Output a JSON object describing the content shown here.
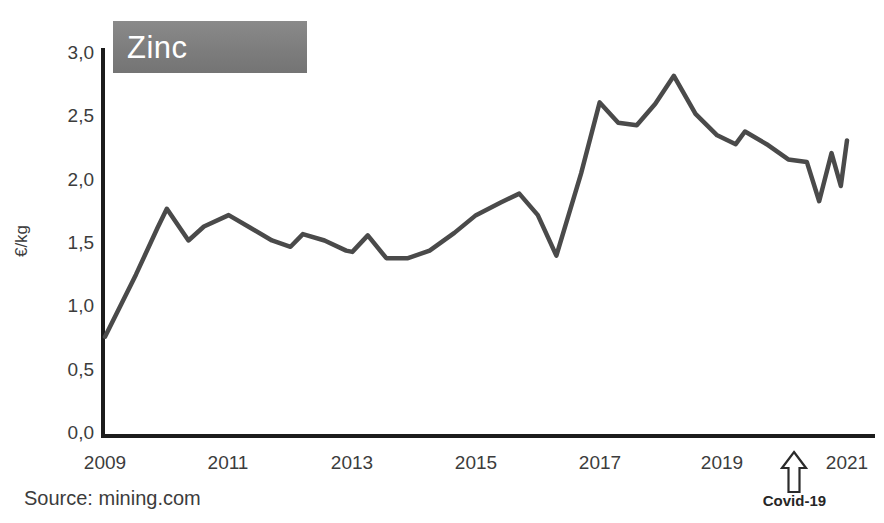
{
  "chart_data": {
    "type": "line",
    "title": "Zinc",
    "xlabel": "",
    "ylabel": "€/kg",
    "ylim": [
      0.0,
      3.0
    ],
    "xlim": [
      2009.0,
      2021.0
    ],
    "yticks": [
      "0,0",
      "0,5",
      "1,0",
      "1,5",
      "2,0",
      "2,5",
      "3,0"
    ],
    "ytick_values": [
      0.0,
      0.5,
      1.0,
      1.5,
      2.0,
      2.5,
      3.0
    ],
    "xticks": [
      "2009",
      "2011",
      "2013",
      "2015",
      "2017",
      "2019",
      "2021"
    ],
    "xtick_values": [
      2009,
      2011,
      2013,
      2015,
      2017,
      2019,
      2021
    ],
    "grid": false,
    "legend": null,
    "series": [
      {
        "name": "Zinc price",
        "unit": "€/kg",
        "color": "#4a4a4a",
        "x": [
          2009.0,
          2009.5,
          2009.85,
          2010.0,
          2010.35,
          2010.6,
          2011.0,
          2011.35,
          2011.7,
          2012.0,
          2012.2,
          2012.55,
          2012.9,
          2013.0,
          2013.25,
          2013.55,
          2013.9,
          2014.25,
          2014.65,
          2015.0,
          2015.4,
          2015.7,
          2016.0,
          2016.3,
          2016.7,
          2017.0,
          2017.3,
          2017.6,
          2017.9,
          2018.2,
          2018.55,
          2018.9,
          2019.2,
          2019.35,
          2019.7,
          2020.05,
          2020.35,
          2020.55,
          2020.75,
          2020.9,
          2021.0
        ],
        "y": [
          0.76,
          1.25,
          1.62,
          1.77,
          1.52,
          1.63,
          1.72,
          1.62,
          1.52,
          1.47,
          1.57,
          1.52,
          1.44,
          1.43,
          1.56,
          1.38,
          1.38,
          1.44,
          1.58,
          1.72,
          1.82,
          1.89,
          1.72,
          1.4,
          2.05,
          2.61,
          2.45,
          2.43,
          2.6,
          2.82,
          2.52,
          2.35,
          2.28,
          2.38,
          2.28,
          2.16,
          2.14,
          1.83,
          2.21,
          1.95,
          2.31
        ]
      }
    ],
    "annotations": [
      {
        "name": "covid-arrow",
        "label": "Covid-19",
        "x": 2020.15,
        "icon": "up-arrow-outline"
      }
    ],
    "source": "Source: mining.com"
  },
  "colors": {
    "line": "#4a4a4a",
    "axis": "#1c1c1c",
    "title_badge": "#7d7d7d",
    "title_text": "#ffffff",
    "text": "#3c3c3c",
    "background": "#ffffff"
  }
}
